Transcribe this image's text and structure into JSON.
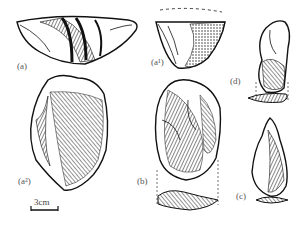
{
  "figure": {
    "type": "archaeological stone tool illustration",
    "labels": {
      "a": "(a)",
      "a1": "(a¹)",
      "a2": "(a²)",
      "b": "(b)",
      "c": "(c)",
      "d": "(d)"
    },
    "scale_bar": {
      "label": "3cm"
    },
    "colors": {
      "ink": "#111111",
      "background": "#ffffff",
      "label": "#555555"
    }
  }
}
